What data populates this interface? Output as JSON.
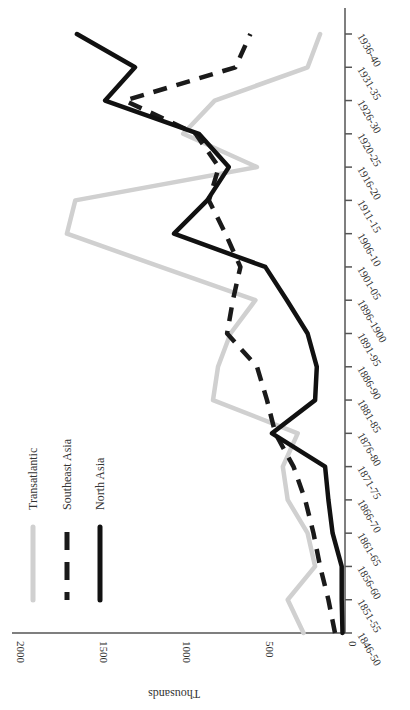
{
  "chart_data": {
    "type": "line",
    "orientation": "rotated-90-clockwise",
    "title": "",
    "xlabel": "",
    "ylabel": "Thousands",
    "ylim": [
      0,
      2000
    ],
    "yticks": [
      0,
      500,
      1000,
      1500,
      2000
    ],
    "ytick_labels": [
      "0",
      "500",
      "1000",
      "1500",
      "2000"
    ],
    "grid": false,
    "legend_position": "inside-lower-left",
    "categories": [
      "1846-50",
      "1851-55",
      "1856-60",
      "1861-65",
      "1866-70",
      "1871-75",
      "1876-80",
      "1881-85",
      "1886-90",
      "1891-95",
      "1896-1900",
      "1901-05",
      "1906-10",
      "1911-15",
      "1916-20",
      "1920-25",
      "1926-30",
      "1931-35",
      "1936-40"
    ],
    "series": [
      {
        "name": "Transatlantic",
        "style": "solid",
        "color": "#d0d0d0",
        "values": [
          250,
          345,
          180,
          225,
          345,
          375,
          285,
          795,
          765,
          690,
          540,
          1110,
          1675,
          1625,
          530,
          975,
          785,
          225,
          150
        ]
      },
      {
        "name": "Southeast Asia",
        "style": "dashed",
        "color": "#1a1a1a",
        "values": [
          60,
          100,
          150,
          190,
          240,
          310,
          420,
          470,
          530,
          710,
          675,
          630,
          720,
          820,
          760,
          900,
          1325,
          660,
          570
        ]
      },
      {
        "name": "North Asia",
        "style": "solid",
        "color": "#111111",
        "values": [
          15,
          20,
          20,
          75,
          100,
          120,
          440,
          180,
          170,
          225,
          350,
          480,
          1030,
          830,
          700,
          880,
          1445,
          1265,
          1615
        ]
      }
    ]
  },
  "layout": {
    "axis_x": 345,
    "cat_first_y": 633,
    "cat_last_y": 34,
    "value_px_per_unit": 0.166,
    "axis_color": "#555555"
  }
}
